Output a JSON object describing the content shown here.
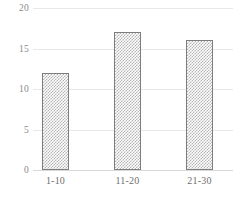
{
  "chart_data": {
    "type": "bar",
    "title": "",
    "subtitle": "",
    "xlabel": "",
    "ylabel": "",
    "categories": [
      "1-10",
      "11-20",
      "21-30"
    ],
    "values": [
      12,
      17,
      16
    ],
    "ylim": [
      0,
      20
    ],
    "yticks": [
      0,
      5,
      10,
      15,
      20
    ],
    "ytick_labels": [
      "0",
      "5",
      "10",
      "15",
      "20"
    ],
    "grid": true,
    "grid_axis": "y",
    "legend": false,
    "legend_position": "none",
    "series": [
      {
        "name": "",
        "values": [
          12,
          17,
          16
        ]
      }
    ],
    "style": {
      "bar_fill": "#b4b4b4",
      "bar_pattern": "checkered",
      "bar_border": "#7d7d7d",
      "gridline_color": "#e8e8e8",
      "baseline_color": "#d9d9d9",
      "tick_label_color": "#8a8a8a",
      "category_label_color": "#6f6f6f",
      "background": "#ffffff"
    }
  }
}
